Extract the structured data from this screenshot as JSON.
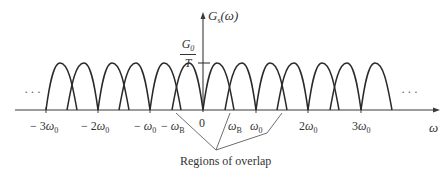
{
  "diagram": {
    "y_axis_label": {
      "main": "G",
      "sub": "s",
      "arg": "(ω)"
    },
    "x_axis_label": "ω",
    "peak_level_label": {
      "numerator_main": "G",
      "numerator_sub": "0",
      "denominator": "T"
    },
    "ellipsis_left": "···",
    "ellipsis_right": "···",
    "ticks": [
      {
        "id": "m3w0",
        "prefix": "− 3",
        "sym": "ω",
        "sub": "0"
      },
      {
        "id": "m2w0",
        "prefix": "− 2",
        "sym": "ω",
        "sub": "0"
      },
      {
        "id": "m1w0",
        "prefix": "− ",
        "sym": "ω",
        "sub": "0"
      },
      {
        "id": "mwB",
        "prefix": "− ",
        "sym": "ω",
        "sub": "B"
      },
      {
        "id": "zero",
        "prefix": "0",
        "sym": "",
        "sub": ""
      },
      {
        "id": "wB",
        "prefix": "",
        "sym": "ω",
        "sub": "B"
      },
      {
        "id": "w0",
        "prefix": "",
        "sym": "ω",
        "sub": "0"
      },
      {
        "id": "2w0",
        "prefix": "2",
        "sym": "ω",
        "sub": "0"
      },
      {
        "id": "3w0",
        "prefix": "3",
        "sym": "ω",
        "sub": "0"
      }
    ],
    "annotation": "Regions of overlap",
    "replica_centers": [
      -3,
      -2,
      -1,
      0,
      1,
      2,
      3
    ],
    "bandwidth_ratio": "ω_B > ω_0/2 (lobes overlap near (k+½)ω_0)",
    "colors": {
      "ink": "#2a2a2a",
      "background": "#ffffff"
    }
  }
}
